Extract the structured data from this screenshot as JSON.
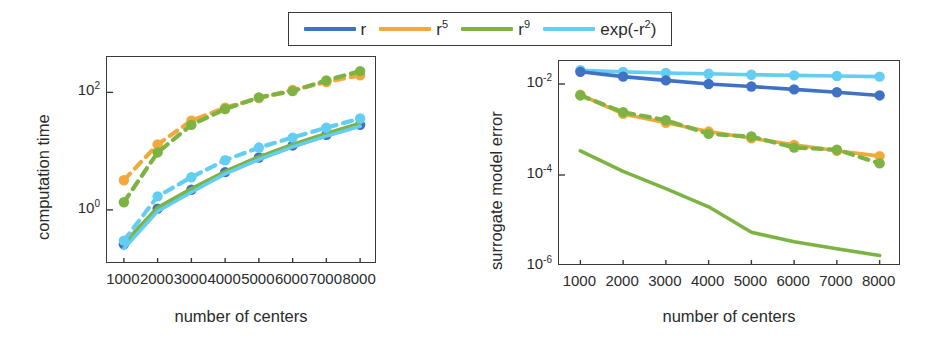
{
  "figure": {
    "width": 946,
    "height": 345,
    "background": "#ffffff"
  },
  "colors": {
    "r": "#3f72c4",
    "r5": "#f2a93b",
    "r9": "#7cb342",
    "expr2": "#63cdf2",
    "axis": "#3a3a3a",
    "text": "#2b2b2b"
  },
  "legend": {
    "position": "top-center",
    "border": true,
    "entries": [
      {
        "key": "r",
        "label": "r",
        "sup": "",
        "color": "#3f72c4"
      },
      {
        "key": "r5",
        "label": "r",
        "sup": "5",
        "color": "#f2a93b"
      },
      {
        "key": "r9",
        "label": "r",
        "sup": "9",
        "color": "#7cb342"
      },
      {
        "key": "expr2",
        "label": "exp(-r",
        "sup": "2",
        "color": "#63cdf2",
        "tail": ")"
      }
    ]
  },
  "chart_data": [
    {
      "id": "computation-time",
      "type": "line",
      "title": "",
      "xlabel": "number of centers",
      "ylabel": "computation time",
      "xscale": "linear",
      "yscale": "log",
      "xlim": [
        500,
        8500
      ],
      "ylim": [
        0.12,
        400
      ],
      "xticks": [
        1000,
        2000,
        3000,
        4000,
        5000,
        6000,
        7000,
        8000
      ],
      "xticklabels": [
        "1000",
        "2000",
        "3000",
        "4000",
        "5000",
        "6000",
        "7000",
        "8000"
      ],
      "yticks": [
        1,
        100
      ],
      "yticklabels": [
        "10",
        "10"
      ],
      "ytickexp": [
        "0",
        "2"
      ],
      "grid": false,
      "x": [
        1000,
        2000,
        3000,
        4000,
        5000,
        6000,
        7000,
        8000
      ],
      "series": [
        {
          "name": "r",
          "color": "#3f72c4",
          "style": "solid",
          "markers": false,
          "values": [
            0.26,
            1.0,
            2.1,
            4.2,
            7.4,
            12.0,
            18.5,
            27.0
          ]
        },
        {
          "name": "r (dashed+markers)",
          "color": "#3f72c4",
          "style": "dashed",
          "markers": true,
          "values": [
            0.26,
            1.05,
            2.2,
            4.4,
            7.8,
            12.5,
            19.0,
            28.0
          ]
        },
        {
          "name": "r5",
          "color": "#f2a93b",
          "style": "dashed",
          "markers": true,
          "values": [
            3.2,
            13.0,
            33.0,
            55.0,
            80.0,
            110.0,
            150.0,
            195.0
          ]
        },
        {
          "name": "r9 solid",
          "color": "#7cb342",
          "style": "solid",
          "markers": false,
          "values": [
            0.27,
            1.1,
            2.3,
            4.5,
            8.0,
            13.0,
            20.0,
            30.0
          ]
        },
        {
          "name": "r9",
          "color": "#7cb342",
          "style": "dashed",
          "markers": true,
          "values": [
            1.35,
            9.5,
            28.0,
            52.0,
            82.0,
            105.0,
            160.0,
            230.0
          ]
        },
        {
          "name": "exp(-r2)",
          "color": "#63cdf2",
          "style": "dashed",
          "markers": true,
          "values": [
            0.3,
            1.7,
            3.6,
            7.0,
            11.5,
            17.0,
            25.0,
            36.0
          ]
        },
        {
          "name": "exp(-r2) solid",
          "color": "#63cdf2",
          "style": "solid",
          "markers": false,
          "values": [
            0.22,
            0.95,
            2.0,
            4.1,
            7.2,
            11.8,
            18.0,
            26.5
          ]
        }
      ]
    },
    {
      "id": "surrogate-model-error",
      "type": "line",
      "title": "",
      "xlabel": "number of centers",
      "ylabel": "surrogate model error",
      "xscale": "linear",
      "yscale": "log",
      "xlim": [
        500,
        8500
      ],
      "ylim": [
        1e-06,
        0.032
      ],
      "xticks": [
        1000,
        2000,
        3000,
        4000,
        5000,
        6000,
        7000,
        8000
      ],
      "xticklabels": [
        "1000",
        "2000",
        "3000",
        "4000",
        "5000",
        "6000",
        "7000",
        "8000"
      ],
      "yticks": [
        0.01,
        0.0001,
        1e-06
      ],
      "yticklabels": [
        "10",
        "10",
        "10"
      ],
      "ytickexp": [
        "-2",
        "-4",
        "-6"
      ],
      "grid": false,
      "x": [
        1000,
        2000,
        3000,
        4000,
        5000,
        6000,
        7000,
        8000
      ],
      "series": [
        {
          "name": "exp(-r2)",
          "color": "#63cdf2",
          "style": "solid",
          "markers": true,
          "values": [
            0.02,
            0.0185,
            0.0175,
            0.0168,
            0.016,
            0.0155,
            0.015,
            0.0145
          ]
        },
        {
          "name": "r",
          "color": "#3f72c4",
          "style": "solid",
          "markers": true,
          "values": [
            0.0185,
            0.0145,
            0.012,
            0.01,
            0.0088,
            0.0076,
            0.0066,
            0.0056
          ]
        },
        {
          "name": "r5",
          "color": "#f2a93b",
          "style": "solid",
          "markers": true,
          "values": [
            0.0058,
            0.0022,
            0.0014,
            0.0009,
            0.00064,
            0.00046,
            0.00034,
            0.00026
          ]
        },
        {
          "name": "r9",
          "color": "#7cb342",
          "style": "dashed",
          "markers": true,
          "values": [
            0.0056,
            0.0024,
            0.0016,
            0.0008,
            0.0007,
            0.0004,
            0.00036,
            0.00018
          ]
        },
        {
          "name": "r9 solid",
          "color": "#7cb342",
          "style": "solid",
          "markers": false,
          "values": [
            0.00034,
            0.00012,
            5e-05,
            2e-05,
            5.5e-06,
            3.4e-06,
            2.4e-06,
            1.7e-06
          ]
        }
      ]
    }
  ]
}
